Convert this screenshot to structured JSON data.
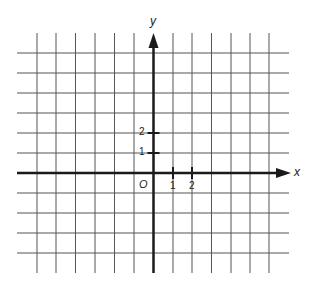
{
  "diagram": {
    "type": "coordinate-plane",
    "axes": {
      "x_label": "x",
      "y_label": "y",
      "origin_label": "O"
    },
    "x_ticks": [
      {
        "value": 1,
        "label": "1"
      },
      {
        "value": 2,
        "label": "2"
      }
    ],
    "y_ticks": [
      {
        "value": 1,
        "label": "1"
      },
      {
        "value": 2,
        "label": "2"
      }
    ],
    "grid": {
      "x_range": [
        -6,
        6
      ],
      "y_range": [
        -5,
        6
      ],
      "unit_px": 19.5
    },
    "colors": {
      "grid": "#555555",
      "axis": "#1a1a1a",
      "background": "#ffffff"
    }
  }
}
